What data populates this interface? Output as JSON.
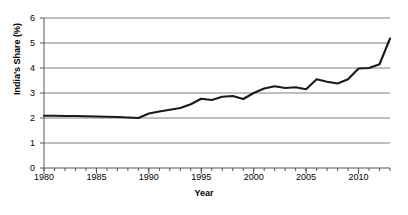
{
  "chart_data": {
    "type": "line",
    "title": "",
    "xlabel": "Year",
    "ylabel": "India's Share (%)",
    "xlim": [
      1980,
      2013
    ],
    "ylim": [
      0,
      6
    ],
    "ytick_labels": [
      "0",
      "1",
      "2",
      "3",
      "4",
      "5",
      "6"
    ],
    "ytick_values": [
      0,
      1,
      2,
      3,
      4,
      5,
      6
    ],
    "xtick_labels": [
      "1980",
      "1985",
      "1990",
      "1995",
      "2000",
      "2005",
      "2010"
    ],
    "xtick_values": [
      1980,
      1985,
      1990,
      1995,
      2000,
      2005,
      2010
    ],
    "minor_xticks": true,
    "grid": "horizontal",
    "legend": "none",
    "line_color": "#1a1a1a",
    "grid_color": "#808080",
    "axis_color": "#555555",
    "background": "#ffffff",
    "series": [
      {
        "name": "India's Share",
        "x": [
          1980,
          1981,
          1982,
          1983,
          1984,
          1985,
          1986,
          1987,
          1988,
          1989,
          1990,
          1991,
          1992,
          1993,
          1994,
          1995,
          1996,
          1997,
          1998,
          1999,
          2000,
          2001,
          2002,
          2003,
          2004,
          2005,
          2006,
          2007,
          2008,
          2009,
          2010,
          2011,
          2012,
          2013
        ],
        "values": [
          2.09,
          2.09,
          2.08,
          2.08,
          2.07,
          2.06,
          2.05,
          2.04,
          2.02,
          2.0,
          2.18,
          2.26,
          2.33,
          2.4,
          2.55,
          2.77,
          2.72,
          2.85,
          2.88,
          2.76,
          3.0,
          3.18,
          3.27,
          3.2,
          3.23,
          3.15,
          3.55,
          3.45,
          3.38,
          3.55,
          3.98,
          4.0,
          4.15,
          5.18
        ]
      }
    ]
  }
}
